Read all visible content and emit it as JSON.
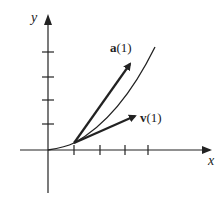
{
  "diagram": {
    "axes": {
      "x_label": "x",
      "y_label": "y"
    },
    "x_ticks": 4,
    "y_ticks": 4,
    "curve": "parabola-like curve through origin",
    "vectors": [
      {
        "name": "a",
        "label_bold": "a",
        "label_arg": "(1)",
        "description": "acceleration vector at t=1"
      },
      {
        "name": "v",
        "label_bold": "v",
        "label_arg": "(1)",
        "description": "velocity vector at t=1 (tangent to curve)"
      }
    ],
    "colors": {
      "ink": "#222222",
      "background": "#ffffff"
    }
  }
}
